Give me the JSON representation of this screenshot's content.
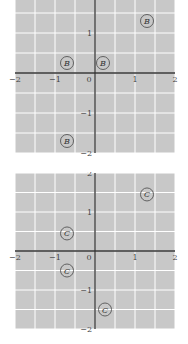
{
  "chart_data": [
    {
      "type": "scatter",
      "title": "",
      "xlabel": "",
      "ylabel": "",
      "xlim": [
        -2,
        2
      ],
      "ylim": [
        -2,
        2
      ],
      "grid": true,
      "grid_step": 0.5,
      "background": "#c8c8c8",
      "grid_color": "#ffffff",
      "axis_color": "#333333",
      "x_ticks": [
        "-2",
        "-1",
        "0",
        "1",
        "2"
      ],
      "y_ticks": [
        "1",
        "-1",
        "-2"
      ],
      "marker_label": "B",
      "points": [
        {
          "x": 1.3,
          "y": 1.3,
          "label": "B"
        },
        {
          "x": -0.7,
          "y": 0.25,
          "label": "B"
        },
        {
          "x": 0.2,
          "y": 0.25,
          "label": "B"
        },
        {
          "x": -0.7,
          "y": -1.7,
          "label": "B"
        }
      ]
    },
    {
      "type": "scatter",
      "title": "",
      "xlabel": "",
      "ylabel": "",
      "xlim": [
        -2,
        2
      ],
      "ylim": [
        -2,
        2
      ],
      "grid": true,
      "grid_step": 0.5,
      "background": "#c8c8c8",
      "grid_color": "#ffffff",
      "axis_color": "#333333",
      "x_ticks": [
        "-2",
        "-1",
        "0",
        "1",
        "2"
      ],
      "y_ticks": [
        "2",
        "1",
        "-1",
        "-2"
      ],
      "marker_label": "C",
      "points": [
        {
          "x": 1.3,
          "y": 1.45,
          "label": "C"
        },
        {
          "x": -0.7,
          "y": 0.45,
          "label": "C"
        },
        {
          "x": -0.7,
          "y": -0.5,
          "label": "C"
        },
        {
          "x": 0.25,
          "y": -1.5,
          "label": "C"
        }
      ]
    }
  ]
}
